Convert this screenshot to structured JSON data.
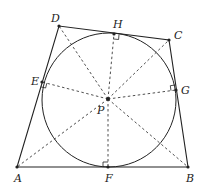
{
  "diagram": {
    "type": "geometry",
    "colors": {
      "stroke": "#222222",
      "background": "#ffffff"
    },
    "circle": {
      "center": "P",
      "cx": 109,
      "cy": 100,
      "r": 67
    },
    "points": {
      "A": {
        "label": "A",
        "x": 17,
        "y": 167
      },
      "B": {
        "label": "B",
        "x": 188,
        "y": 167
      },
      "C": {
        "label": "C",
        "x": 169,
        "y": 40
      },
      "D": {
        "label": "D",
        "x": 59,
        "y": 26
      },
      "E": {
        "label": "E",
        "x": 42,
        "y": 82
      },
      "F": {
        "label": "F",
        "x": 108,
        "y": 167
      },
      "G": {
        "label": "G",
        "x": 176,
        "y": 90
      },
      "H": {
        "label": "H",
        "x": 114,
        "y": 34
      },
      "P": {
        "label": "P",
        "x": 108,
        "y": 99
      }
    },
    "solid_edges": [
      "AB",
      "BC",
      "CD",
      "DA"
    ],
    "dashed_segments": [
      "PA",
      "PB",
      "PC",
      "PD",
      "PE",
      "PF",
      "PG",
      "PH"
    ],
    "right_angle_marks": [
      "E",
      "F",
      "G",
      "H"
    ]
  }
}
